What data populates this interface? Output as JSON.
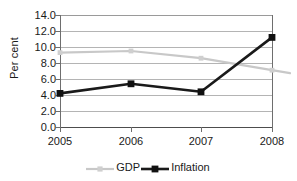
{
  "chart_data": {
    "type": "line",
    "title": "",
    "xlabel": "",
    "ylabel": "Per cent",
    "categories": [
      "2005",
      "2006",
      "2007",
      "2008"
    ],
    "ylim": [
      0.0,
      14.0
    ],
    "ytick_step": 2.0,
    "yticks": [
      "14.0",
      "12.0",
      "10.0",
      "8.0",
      "6.0",
      "4.0",
      "2.0",
      "0.0"
    ],
    "grid": "horizontal",
    "legend_position": "bottom",
    "series": [
      {
        "name": "GDP",
        "values": [
          9.3,
          9.5,
          8.6,
          7.1
        ],
        "color": "#c8c8c8",
        "marker": "small-square"
      },
      {
        "name": "Inflation",
        "values": [
          4.2,
          5.4,
          4.4,
          11.2
        ],
        "color": "#1a1a1a",
        "marker": "filled-square"
      }
    ]
  },
  "axes": {
    "y_title": "Per cent",
    "y_tick_labels": [
      "14.0",
      "12.0",
      "10.0",
      "8.0",
      "6.0",
      "4.0",
      "2.0",
      "0.0"
    ],
    "x_tick_labels": [
      "2005",
      "2006",
      "2007",
      "2008"
    ]
  },
  "legend": {
    "items": [
      {
        "label": "GDP",
        "color": "#c8c8c8"
      },
      {
        "label": "Inflation",
        "color": "#1a1a1a"
      }
    ]
  },
  "colors": {
    "gdp": "#c8c8c8",
    "inflation": "#1a1a1a",
    "grid": "#9a9a9a",
    "axis": "#6e6e6e",
    "background": "#ffffff"
  }
}
